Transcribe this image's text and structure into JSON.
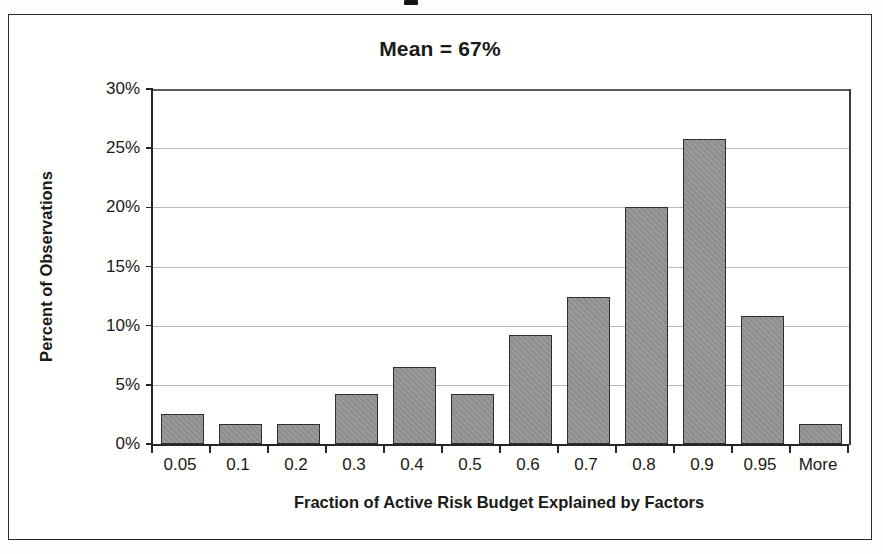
{
  "chart_data": {
    "type": "bar",
    "title": "Mean = 67%",
    "xlabel": "Fraction of Active Risk Budget Explained by Factors",
    "ylabel": "Percent of Observations",
    "categories": [
      "0.05",
      "0.1",
      "0.2",
      "0.3",
      "0.4",
      "0.5",
      "0.6",
      "0.7",
      "0.8",
      "0.9",
      "0.95",
      "More"
    ],
    "values": [
      2.5,
      1.7,
      1.7,
      4.2,
      6.5,
      4.2,
      9.2,
      12.4,
      20.0,
      25.8,
      10.8,
      1.7
    ],
    "ylim": [
      0,
      30
    ],
    "ytick_values": [
      0,
      5,
      10,
      15,
      20,
      25,
      30
    ],
    "ytick_labels": [
      "0%",
      "5%",
      "10%",
      "15%",
      "20%",
      "25%",
      "30%"
    ],
    "grid": true,
    "legend": false,
    "bar_fill_color": "#8d8d8d",
    "bar_edge_color": "#2e2e2e",
    "axis_color": "#262626",
    "gridline_color": "#b9b9b9",
    "background_color": "#fffffd",
    "annotations": [
      "Mean = 67%"
    ]
  }
}
